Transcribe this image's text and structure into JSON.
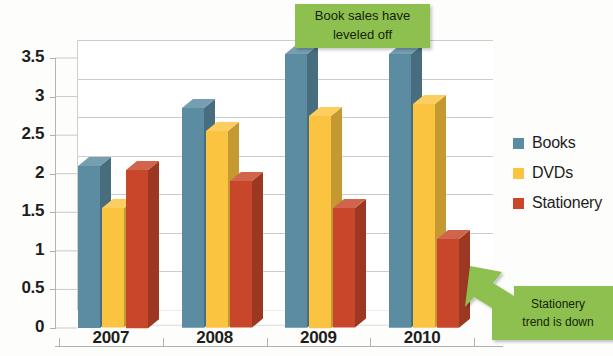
{
  "chart_data": {
    "type": "bar",
    "title": "",
    "subtitle": "",
    "xlabel": "",
    "ylabel": "",
    "categories": [
      "2007",
      "2008",
      "2009",
      "2010"
    ],
    "series": [
      {
        "name": "Books",
        "color": "#5b8ca2",
        "values": [
          2.1,
          2.85,
          3.55,
          3.55
        ]
      },
      {
        "name": "DVDs",
        "color": "#fbc440",
        "values": [
          1.55,
          2.55,
          2.75,
          2.9
        ]
      },
      {
        "name": "Stationery",
        "color": "#c8472b",
        "values": [
          2.05,
          1.9,
          1.55,
          1.15
        ]
      }
    ],
    "ylim": [
      0,
      3.5
    ],
    "yticks": [
      "0",
      "0.5",
      "1",
      "1.5",
      "2",
      "2.5",
      "3",
      "3.5"
    ],
    "ytick_values": [
      0,
      0.5,
      1,
      1.5,
      2,
      2.5,
      3,
      3.5
    ],
    "grid": true,
    "legend_position": "right",
    "style": "3d-clustered-column",
    "annotations": [
      {
        "id": "top-callout",
        "text": "Book sales have leveled off",
        "line1": "Book sales have",
        "line2": "leveled off",
        "color": "#8ec04f",
        "shape": "rectangle"
      },
      {
        "id": "arrow-callout",
        "text": "Stationery trend is down",
        "line1": "Stationery",
        "line2": "trend is down",
        "color": "#8ec04f",
        "shape": "block-arrow",
        "points_to": "2010 Stationery bar"
      }
    ]
  },
  "legend": {
    "items": [
      {
        "label": "Books",
        "color": "#5b8ca2"
      },
      {
        "label": "DVDs",
        "color": "#fbc440"
      },
      {
        "label": "Stationery",
        "color": "#c8472b"
      }
    ]
  },
  "axis": {
    "y_labels": [
      "3.5",
      "3",
      "2.5",
      "2",
      "1.5",
      "1",
      "0.5",
      "0"
    ],
    "x_labels": [
      "2007",
      "2008",
      "2009",
      "2010"
    ]
  },
  "annotations": {
    "top": {
      "line1": "Book sales have",
      "line2": "leveled off"
    },
    "bottom": {
      "line1": "Stationery",
      "line2": "trend is down"
    }
  }
}
